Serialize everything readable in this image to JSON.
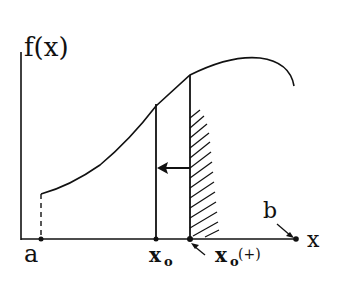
{
  "diagram": {
    "y_axis_label": "f(x)",
    "x_axis_label": "x",
    "labels": {
      "a": "a",
      "b": "b",
      "x0": "x",
      "x0_sub": "o",
      "x0plus": "x",
      "x0plus_sub": "o",
      "x0plus_suffix": "(+)"
    },
    "colors": {
      "ink": "#111111",
      "background": "#ffffff"
    }
  }
}
